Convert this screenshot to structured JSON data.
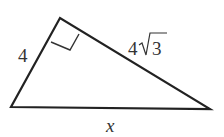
{
  "diagram": {
    "type": "right-triangle",
    "vertices": {
      "top": [
        60,
        18
      ],
      "bottom_left": [
        11,
        107
      ],
      "bottom_right": [
        210,
        109
      ]
    },
    "right_angle_at": "top",
    "labels": {
      "left_side": "4",
      "right_side_coef": "4",
      "right_side_radicand": "3",
      "base": "x"
    },
    "stroke_color": "#222222",
    "text_color": "#333333"
  }
}
